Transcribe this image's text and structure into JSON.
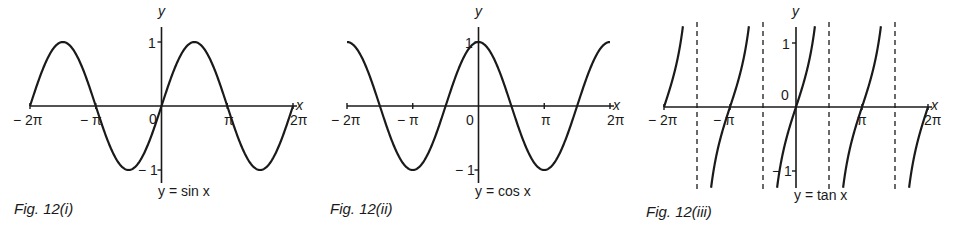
{
  "figures": [
    {
      "caption": "Fig. 12(i)",
      "equation": "y = sin x"
    },
    {
      "caption": "Fig. 12(ii)",
      "equation": "y = cos x"
    },
    {
      "caption": "Fig. 12(iii)",
      "equation": "y = tan x"
    }
  ],
  "axis_labels": {
    "x": "x",
    "y": "y",
    "origin": "0"
  },
  "ticks": {
    "m2pi": "− 2π",
    "mpi": "− π",
    "pi": "π",
    "p2pi": "2π",
    "one": "1",
    "mone": "− 1"
  },
  "chart_data": [
    {
      "type": "line",
      "title": "Fig. 12(i)",
      "equation": "y = sin x",
      "xlabel": "x",
      "ylabel": "y",
      "xlim": [
        -6.283,
        6.283
      ],
      "ylim": [
        -1.2,
        1.2
      ],
      "x_ticks": [
        "-2π",
        "-π",
        "0",
        "π",
        "2π"
      ],
      "y_ticks": [
        "-1",
        "1"
      ],
      "x": [
        -6.283,
        -4.712,
        -3.142,
        -1.571,
        0,
        1.571,
        3.142,
        4.712,
        6.283
      ],
      "y": [
        0,
        1,
        0,
        -1,
        0,
        1,
        0,
        -1,
        0
      ],
      "grid": false
    },
    {
      "type": "line",
      "title": "Fig. 12(ii)",
      "equation": "y = cos x",
      "xlabel": "x",
      "ylabel": "y",
      "xlim": [
        -6.283,
        6.283
      ],
      "ylim": [
        -1.2,
        1.2
      ],
      "x_ticks": [
        "-2π",
        "-π",
        "0",
        "π",
        "2π"
      ],
      "y_ticks": [
        "-1",
        "1"
      ],
      "x": [
        -6.283,
        -4.712,
        -3.142,
        -1.571,
        0,
        1.571,
        3.142,
        4.712,
        6.283
      ],
      "y": [
        1,
        0,
        -1,
        0,
        1,
        0,
        -1,
        0,
        1
      ],
      "grid": false
    },
    {
      "type": "line",
      "title": "Fig. 12(iii)",
      "equation": "y = tan x",
      "xlabel": "x",
      "ylabel": "y",
      "xlim": [
        -6.283,
        6.283
      ],
      "ylim": [
        -1.2,
        1.2
      ],
      "x_ticks": [
        "-2π",
        "-π",
        "0",
        "π",
        "2π"
      ],
      "y_ticks": [
        "-1",
        "1"
      ],
      "asymptotes": [
        -4.712,
        -1.571,
        1.571,
        4.712
      ],
      "zeros": [
        -6.283,
        -3.142,
        0,
        3.142,
        6.283
      ],
      "grid": false
    }
  ]
}
